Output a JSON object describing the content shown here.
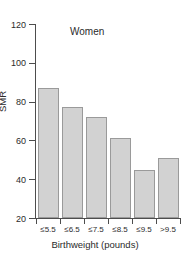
{
  "chart_data": {
    "type": "bar",
    "title": "Women",
    "xlabel": "Birthweight (pounds)",
    "ylabel": "SMR",
    "categories": [
      "≤5.5",
      "≤6.5",
      "≤7.5",
      "≤8.5",
      "≤9.5",
      ">9.5"
    ],
    "values": [
      87,
      77,
      72,
      61,
      45,
      51
    ],
    "ylim": [
      20,
      120
    ],
    "yticks": [
      20,
      40,
      60,
      80,
      100,
      120
    ],
    "ytick_labels": [
      "20",
      "40",
      "60",
      "80",
      "100",
      "120"
    ],
    "grid": false,
    "legend": null,
    "colors": {
      "bar_fill": "#d2d2d2",
      "bar_border": "#9a9a9a",
      "axis": "#4d4d4d",
      "text": "#2b2b2b",
      "background": "#ffffff"
    }
  }
}
